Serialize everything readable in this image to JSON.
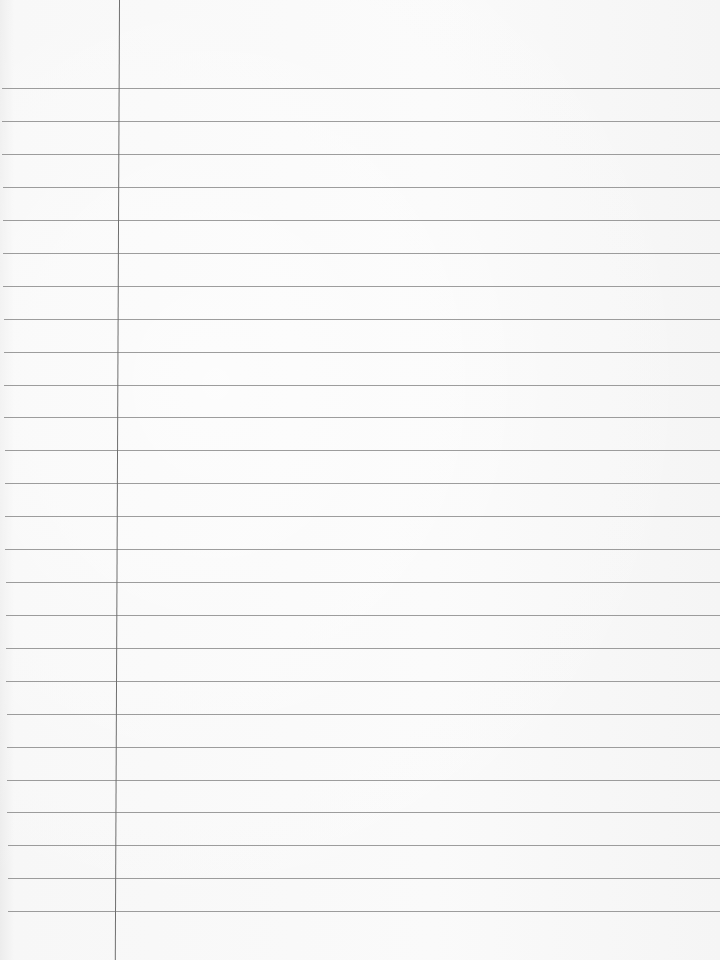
{
  "page": {
    "type": "lined-notebook-paper",
    "background_color": "#f9f9f9",
    "rule_color": "#8c8c8c",
    "margin_color": "#6f6f6f",
    "margin_x": 119,
    "rule_lines_y": [
      88,
      121,
      154,
      187,
      220,
      253,
      286,
      319,
      352,
      385,
      417,
      450,
      483,
      516,
      549,
      582,
      615,
      648,
      681,
      714,
      747,
      780,
      812,
      845,
      878,
      911
    ]
  }
}
